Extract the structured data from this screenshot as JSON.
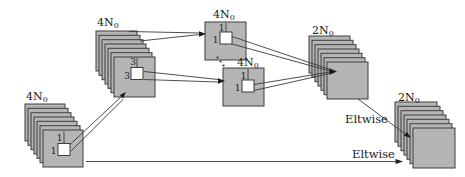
{
  "figure": {
    "blocks": {
      "input": {
        "channels": "4N",
        "channels_sub": "0",
        "kernel_size_v": "1",
        "kernel_size_h": "1"
      },
      "conv3": {
        "channels": "4N",
        "channels_sub": "0",
        "kernel_size_v": "3",
        "kernel_size_h": "3"
      },
      "conv1_top": {
        "channels": "4N",
        "channels_sub": "0",
        "kernel_size_v": "1",
        "kernel_size_h": "1"
      },
      "conv1_bottom": {
        "channels": "4N",
        "channels_sub": "0",
        "kernel_size_v": "1",
        "kernel_size_h": "1"
      },
      "merge": {
        "channels": "2N",
        "channels_sub": "0"
      },
      "output": {
        "channels": "2N",
        "channels_sub": "0"
      }
    },
    "edge_labels": {
      "skip": "Eltwise",
      "main": "Eltwise"
    }
  },
  "colors": {
    "layer_fill": "#b5b5b5",
    "layer_stroke": "#3d3d3d",
    "kernel_fill": "#ffffff",
    "line": "#3a3a3a",
    "arrow": "#1c1c1c",
    "text": "#1a1a1a",
    "bg": "#ffffff"
  }
}
